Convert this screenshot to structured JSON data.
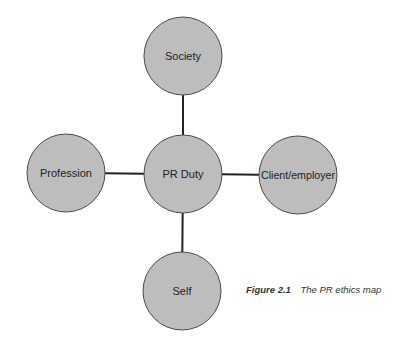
{
  "diagram": {
    "title": "The PR ethics map",
    "type": "hub-and-spoke",
    "style": {
      "node_fill": "#bdbdbd",
      "node_stroke": "#4a4a4a",
      "edge_color": "#222222",
      "text_color": "#222222",
      "node_radius": 39
    },
    "nodes": [
      {
        "id": "society",
        "label": "Society",
        "cx": 183,
        "cy": 56
      },
      {
        "id": "pr-duty",
        "label": "PR Duty",
        "cx": 183,
        "cy": 174
      },
      {
        "id": "profession",
        "label": "Profession",
        "cx": 66,
        "cy": 173
      },
      {
        "id": "client-employer",
        "label": "Client/employer",
        "cx": 298,
        "cy": 175
      },
      {
        "id": "self",
        "label": "Self",
        "cx": 182,
        "cy": 291
      }
    ],
    "edges": [
      {
        "from": "pr-duty",
        "to": "society"
      },
      {
        "from": "pr-duty",
        "to": "profession"
      },
      {
        "from": "pr-duty",
        "to": "client-employer"
      },
      {
        "from": "pr-duty",
        "to": "self"
      }
    ]
  },
  "caption": {
    "figure_number": "Figure 2.1",
    "figure_title": "The PR ethics map"
  }
}
